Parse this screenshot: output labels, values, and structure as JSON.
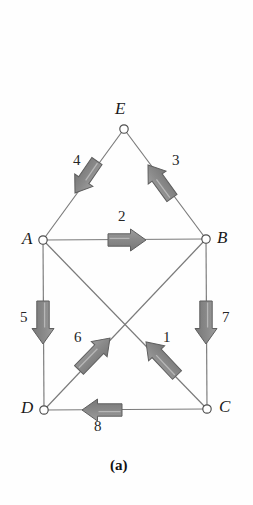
{
  "figure": {
    "caption": "(a)",
    "caption_pos": {
      "x": 110,
      "y": 458
    },
    "background_color": "#fefefe",
    "member_color": "#7a7a7a",
    "arrow_fill": "#8d8d8d",
    "arrow_stroke": "#5e5e5e",
    "node_fill": "#ffffff",
    "node_stroke": "#4d4d4d"
  },
  "nodes": [
    {
      "id": "E",
      "label": "E",
      "cx": 124,
      "cy": 129,
      "r": 4.2,
      "label_x": 115,
      "label_y": 100
    },
    {
      "id": "A",
      "label": "A",
      "cx": 43,
      "cy": 240,
      "r": 4.2,
      "label_x": 22,
      "label_y": 230
    },
    {
      "id": "B",
      "label": "B",
      "cx": 206,
      "cy": 239,
      "r": 4.2,
      "label_x": 217,
      "label_y": 229
    },
    {
      "id": "D",
      "label": "D",
      "cx": 44,
      "cy": 410,
      "r": 4.2,
      "label_x": 21,
      "label_y": 399
    },
    {
      "id": "C",
      "label": "C",
      "cx": 207,
      "cy": 409,
      "r": 4.2,
      "label_x": 219,
      "label_y": 398
    }
  ],
  "members": [
    {
      "from": "E",
      "to": "A",
      "x1": 124,
      "y1": 129,
      "x2": 43,
      "y2": 240
    },
    {
      "from": "E",
      "to": "B",
      "x1": 124,
      "y1": 129,
      "x2": 206,
      "y2": 239
    },
    {
      "from": "A",
      "to": "B",
      "x1": 43,
      "y1": 240,
      "x2": 206,
      "y2": 239
    },
    {
      "from": "A",
      "to": "D",
      "x1": 43,
      "y1": 240,
      "x2": 44,
      "y2": 410
    },
    {
      "from": "B",
      "to": "C",
      "x1": 206,
      "y1": 239,
      "x2": 207,
      "y2": 409
    },
    {
      "from": "D",
      "to": "C",
      "x1": 44,
      "y1": 410,
      "x2": 207,
      "y2": 409
    },
    {
      "from": "A",
      "to": "C",
      "x1": 43,
      "y1": 240,
      "x2": 207,
      "y2": 409
    },
    {
      "from": "B",
      "to": "D",
      "x1": 206,
      "y1": 239,
      "x2": 44,
      "y2": 410
    }
  ],
  "forces": [
    {
      "id": "1",
      "label": "1",
      "member": "C-A",
      "direction": "up-left",
      "angle_deg": 225,
      "tail_x": 177,
      "tail_y": 375,
      "head_x": 146,
      "head_y": 342,
      "label_x": 163,
      "label_y": 330
    },
    {
      "id": "2",
      "label": "2",
      "member": "A-B",
      "direction": "right",
      "angle_deg": 0,
      "tail_x": 108,
      "tail_y": 240,
      "head_x": 146,
      "head_y": 240,
      "label_x": 118,
      "label_y": 209
    },
    {
      "id": "3",
      "label": "3",
      "member": "B-E",
      "direction": "up-left",
      "angle_deg": 233,
      "tail_x": 172,
      "tail_y": 198,
      "head_x": 148,
      "head_y": 165,
      "label_x": 172,
      "label_y": 153
    },
    {
      "id": "4",
      "label": "4",
      "member": "E-A",
      "direction": "down-left",
      "angle_deg": 127,
      "tail_x": 97,
      "tail_y": 161,
      "head_x": 75,
      "head_y": 193,
      "label_x": 73,
      "label_y": 153
    },
    {
      "id": "5",
      "label": "5",
      "member": "A-D",
      "direction": "down",
      "angle_deg": 90,
      "tail_x": 43,
      "tail_y": 301,
      "head_x": 43,
      "head_y": 344,
      "label_x": 20,
      "label_y": 310
    },
    {
      "id": "6",
      "label": "6",
      "member": "D-B",
      "direction": "up-right",
      "angle_deg": 313,
      "tail_x": 79,
      "tail_y": 370,
      "head_x": 110,
      "head_y": 338,
      "label_x": 74,
      "label_y": 330
    },
    {
      "id": "7",
      "label": "7",
      "member": "B-C",
      "direction": "down",
      "angle_deg": 90,
      "tail_x": 206,
      "tail_y": 301,
      "head_x": 206,
      "head_y": 344,
      "label_x": 222,
      "label_y": 310
    },
    {
      "id": "8",
      "label": "8",
      "member": "C-D",
      "direction": "left",
      "angle_deg": 180,
      "tail_x": 122,
      "tail_y": 410,
      "head_x": 82,
      "head_y": 410,
      "label_x": 94,
      "label_y": 419
    }
  ]
}
